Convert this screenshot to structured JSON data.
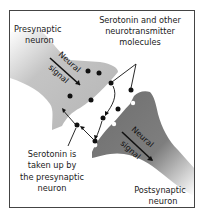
{
  "diagram": {
    "labels": {
      "presynaptic": [
        "Presynaptic",
        "neuron"
      ],
      "postsynaptic": [
        "Postsynaptic",
        "neuron"
      ],
      "molecules": [
        "Serotonin and other",
        "neurotransmitter",
        "molecules"
      ],
      "reuptake": [
        "Serotonin is",
        "taken up by",
        "the presynaptic",
        "neuron"
      ],
      "signal_pre": [
        "Neural",
        "signal"
      ],
      "signal_post": [
        "Neural",
        "signal"
      ]
    },
    "colors": {
      "presynaptic_fill": "#b9b9b9",
      "postsynaptic_fill": "#7a7a7a",
      "molecule": "#111111",
      "border": "#444444"
    }
  }
}
